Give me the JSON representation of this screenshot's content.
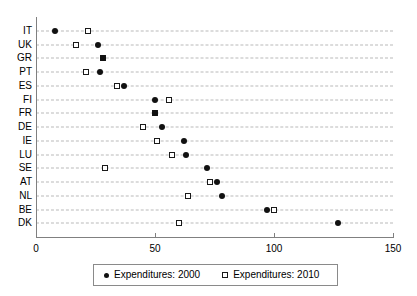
{
  "chart_data": {
    "type": "scatter",
    "title": "",
    "subtitle": "",
    "xlabel": "",
    "ylabel": "",
    "orientation": "horizontal",
    "categories": [
      "IT",
      "UK",
      "GR",
      "PT",
      "ES",
      "FI",
      "FR",
      "DE",
      "IE",
      "LU",
      "SE",
      "AT",
      "NL",
      "BE",
      "DK"
    ],
    "xlim": [
      0,
      150
    ],
    "xticks": [
      0,
      50,
      100,
      150
    ],
    "xtick_labels": [
      "0",
      "50",
      "100",
      "150"
    ],
    "grid": "horizontal-dashed",
    "legend_position": "bottom-center",
    "series": [
      {
        "name": "Expenditures: 2000",
        "marker": "filled-circle",
        "color": "#111111",
        "values": [
          8,
          26,
          28,
          27,
          37,
          50,
          50,
          53,
          62,
          63,
          72,
          76,
          78,
          97,
          127
        ]
      },
      {
        "name": "Expenditures: 2010",
        "marker": "open-square",
        "color": "#1a1a1a",
        "values": [
          22,
          17,
          28,
          21,
          34,
          56,
          50,
          45,
          51,
          57,
          29,
          73,
          64,
          100,
          60
        ]
      }
    ]
  },
  "legend": {
    "entries": [
      {
        "label": "Expenditures: 2000",
        "marker": "filled-circle"
      },
      {
        "label": "Expenditures: 2010",
        "marker": "open-square"
      }
    ]
  }
}
